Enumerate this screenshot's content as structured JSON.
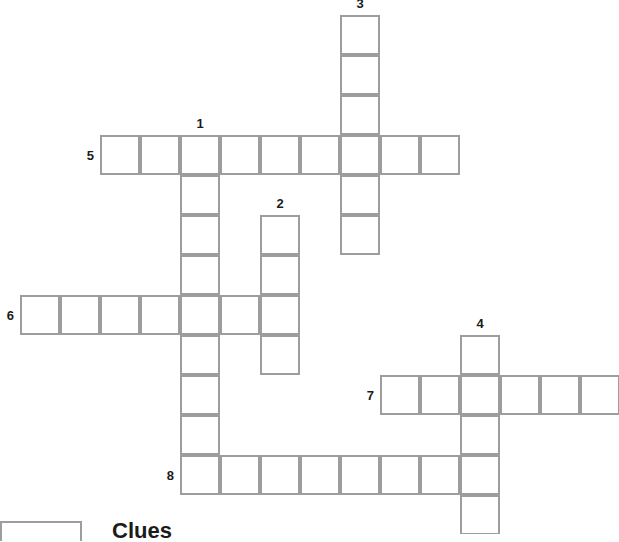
{
  "puzzle": {
    "title_partial": "Clues",
    "cell_size": 40,
    "border_color": "#9d9d9d",
    "cell_fill": "#ffffff",
    "number_color": "#1b1b1b",
    "canvas": {
      "width": 619,
      "height": 534
    },
    "entries": [
      {
        "number": "1",
        "direction": "down",
        "length": 9,
        "start_x": 180,
        "start_y": 135,
        "label_x": 200,
        "label_y": 130,
        "label_place": "above"
      },
      {
        "number": "2",
        "direction": "down",
        "length": 4,
        "start_x": 260,
        "start_y": 215,
        "label_x": 280,
        "label_y": 210,
        "label_place": "above"
      },
      {
        "number": "3",
        "direction": "down",
        "length": 6,
        "start_x": 340,
        "start_y": 15,
        "label_x": 360,
        "label_y": 10,
        "label_place": "above"
      },
      {
        "number": "4",
        "direction": "down",
        "length": 5,
        "start_x": 460,
        "start_y": 335,
        "label_x": 480,
        "label_y": 330,
        "label_place": "above"
      },
      {
        "number": "5",
        "direction": "across",
        "length": 9,
        "start_x": 100,
        "start_y": 135,
        "label_x": 94,
        "label_y": 155,
        "label_place": "left"
      },
      {
        "number": "6",
        "direction": "across",
        "length": 7,
        "start_x": 20,
        "start_y": 295,
        "label_x": 14,
        "label_y": 315,
        "label_place": "left"
      },
      {
        "number": "7",
        "direction": "across",
        "length": 6,
        "start_x": 380,
        "start_y": 375,
        "label_x": 374,
        "label_y": 395,
        "label_place": "left"
      },
      {
        "number": "8",
        "direction": "across",
        "length": 8,
        "start_x": 180,
        "start_y": 455,
        "label_x": 174,
        "label_y": 475,
        "label_place": "left"
      }
    ],
    "footer": {
      "box": {
        "x": 0,
        "y": 521,
        "width": 82,
        "height": 20
      },
      "heading": {
        "x": 112,
        "y": 520,
        "size": 22
      }
    }
  }
}
